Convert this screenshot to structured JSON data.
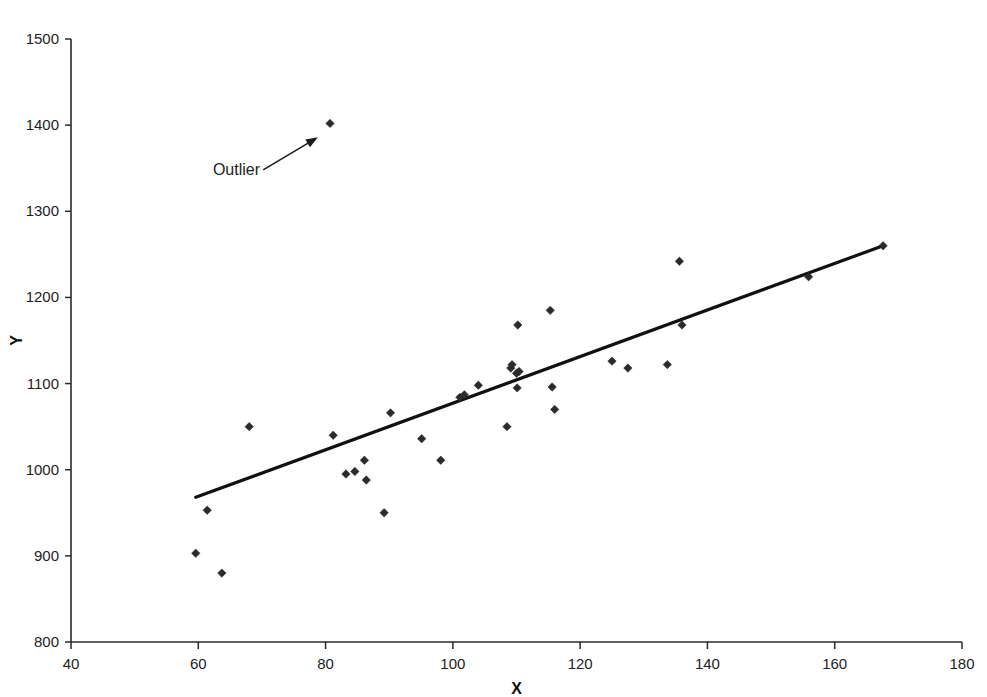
{
  "chart_data": {
    "type": "scatter",
    "title": "",
    "xlabel": "X",
    "ylabel": "Y",
    "xlim": [
      40,
      180
    ],
    "ylim": [
      800,
      1500
    ],
    "xticks": [
      40,
      60,
      80,
      100,
      120,
      140,
      160,
      180
    ],
    "yticks": [
      800,
      900,
      1000,
      1100,
      1200,
      1300,
      1400,
      1500
    ],
    "grid": false,
    "legend": "none",
    "marker": "diamond",
    "marker_color": "#2b2b2b",
    "line_color": "#111111",
    "points": [
      {
        "x": 59.6,
        "y": 903
      },
      {
        "x": 61.4,
        "y": 953
      },
      {
        "x": 63.7,
        "y": 880
      },
      {
        "x": 68.0,
        "y": 1050
      },
      {
        "x": 80.7,
        "y": 1402
      },
      {
        "x": 81.2,
        "y": 1040
      },
      {
        "x": 83.2,
        "y": 995
      },
      {
        "x": 84.6,
        "y": 998
      },
      {
        "x": 86.1,
        "y": 1011
      },
      {
        "x": 86.4,
        "y": 988
      },
      {
        "x": 89.2,
        "y": 950
      },
      {
        "x": 90.2,
        "y": 1066
      },
      {
        "x": 95.1,
        "y": 1036
      },
      {
        "x": 98.1,
        "y": 1011
      },
      {
        "x": 101.1,
        "y": 1084
      },
      {
        "x": 101.8,
        "y": 1087
      },
      {
        "x": 104.0,
        "y": 1098
      },
      {
        "x": 108.5,
        "y": 1050
      },
      {
        "x": 109.1,
        "y": 1118
      },
      {
        "x": 109.3,
        "y": 1122
      },
      {
        "x": 110.0,
        "y": 1112
      },
      {
        "x": 110.4,
        "y": 1114
      },
      {
        "x": 110.1,
        "y": 1095
      },
      {
        "x": 110.2,
        "y": 1168
      },
      {
        "x": 115.3,
        "y": 1185
      },
      {
        "x": 115.6,
        "y": 1096
      },
      {
        "x": 116.0,
        "y": 1070
      },
      {
        "x": 125.0,
        "y": 1126
      },
      {
        "x": 127.5,
        "y": 1118
      },
      {
        "x": 133.7,
        "y": 1122
      },
      {
        "x": 135.6,
        "y": 1242
      },
      {
        "x": 136.0,
        "y": 1168
      },
      {
        "x": 155.9,
        "y": 1224
      },
      {
        "x": 167.6,
        "y": 1260
      }
    ],
    "trendline": {
      "label": "regression-line",
      "x1": 59.6,
      "y1": 968,
      "x2": 167.6,
      "y2": 1260
    },
    "annotations": [
      {
        "text": "Outlier",
        "label_x": 66.0,
        "label_y": 1342,
        "arrow_from_x": 70.2,
        "arrow_from_y": 1348,
        "arrow_to_x": 78.8,
        "arrow_to_y": 1386
      }
    ]
  }
}
